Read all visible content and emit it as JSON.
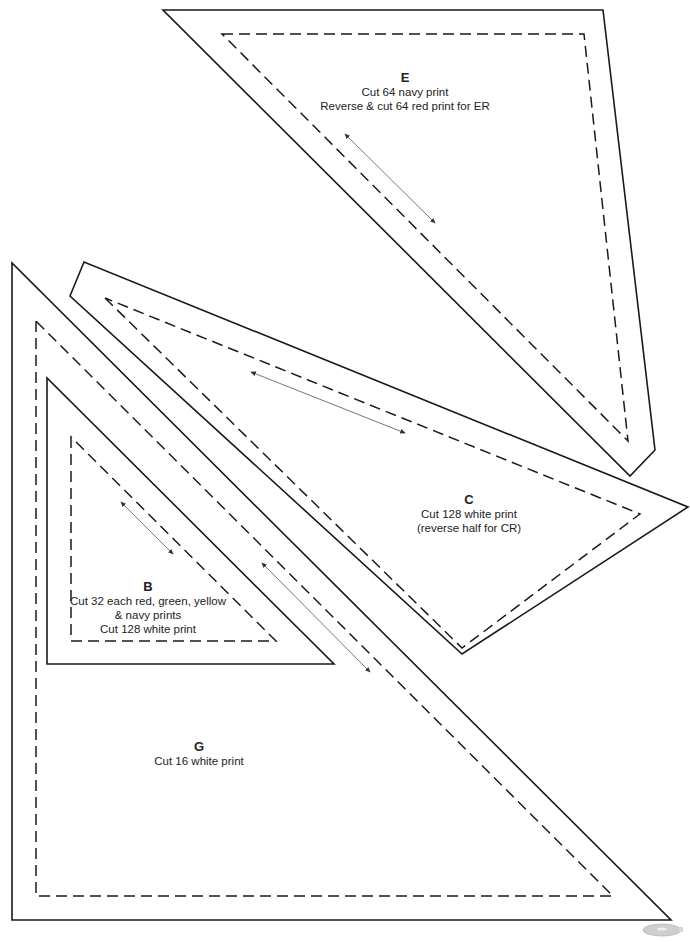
{
  "pieces": {
    "E": {
      "letter": "E",
      "lines": [
        "Cut 64 navy print",
        "Reverse & cut 64 red print for ER"
      ]
    },
    "C": {
      "letter": "C",
      "lines": [
        "Cut 128 white print",
        "(reverse half for CR)"
      ]
    },
    "B": {
      "letter": "B",
      "lines": [
        "Cut 32 each red, green, yellow",
        "& navy prints",
        "Cut 128 white print"
      ]
    },
    "G": {
      "letter": "G",
      "lines": [
        "Cut 16 white print"
      ]
    }
  },
  "colors": {
    "outline": "#1a1a1a",
    "seam": "#1a1a1a",
    "grain_arrow": "#555555",
    "background": "#ffffff"
  },
  "icons": {
    "corner": "tape-spool-icon"
  }
}
